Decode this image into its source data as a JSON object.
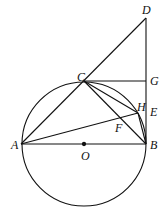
{
  "diagram": {
    "type": "geometry",
    "circle": {
      "center": "O",
      "cx": 84,
      "cy": 144,
      "r": 62
    },
    "points": {
      "A": {
        "x": 21,
        "y": 144
      },
      "O": {
        "x": 84,
        "y": 144
      },
      "B": {
        "x": 146,
        "y": 144
      },
      "C": {
        "x": 84,
        "y": 81
      },
      "D": {
        "x": 146,
        "y": 18
      },
      "G": {
        "x": 146,
        "y": 81
      },
      "H": {
        "x": 138,
        "y": 113
      },
      "E": {
        "x": 146,
        "y": 116
      },
      "F": {
        "x": 120,
        "y": 122
      }
    },
    "segments": [
      [
        "A",
        "B"
      ],
      [
        "A",
        "D"
      ],
      [
        "C",
        "G"
      ],
      [
        "D",
        "B"
      ],
      [
        "C",
        "H"
      ],
      [
        "C",
        "B"
      ],
      [
        "A",
        "H"
      ],
      [
        "H",
        "B"
      ]
    ],
    "labels": [
      {
        "text": "D",
        "x": 142,
        "y": 4
      },
      {
        "text": "C",
        "x": 77,
        "y": 71
      },
      {
        "text": "G",
        "x": 150,
        "y": 75
      },
      {
        "text": "H",
        "x": 137,
        "y": 101
      },
      {
        "text": "E",
        "x": 150,
        "y": 106
      },
      {
        "text": "F",
        "x": 115,
        "y": 122
      },
      {
        "text": "A",
        "x": 11,
        "y": 139
      },
      {
        "text": "O",
        "x": 81,
        "y": 150
      },
      {
        "text": "B",
        "x": 150,
        "y": 139
      }
    ]
  }
}
